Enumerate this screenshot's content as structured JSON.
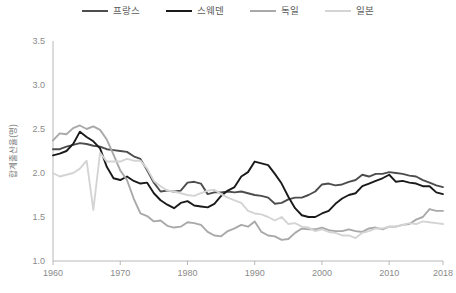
{
  "legend": {
    "position": "top-center",
    "items": [
      {
        "label": "프랑스",
        "color": "#4d4d4d",
        "key": "france"
      },
      {
        "label": "스웨덴",
        "color": "#1a1a1a",
        "key": "sweden"
      },
      {
        "label": "독일",
        "color": "#a9a9a9",
        "key": "germany"
      },
      {
        "label": "일본",
        "color": "#d4d4d4",
        "key": "japan"
      }
    ]
  },
  "axes": {
    "y_title": "합계출산율(명)",
    "y_ticks": [
      "1.0",
      "1.5",
      "2.0",
      "2.5",
      "3.0",
      "3.5"
    ],
    "x_ticks": [
      "1960",
      "1970",
      "1980",
      "1990",
      "2000",
      "2010",
      "2018"
    ]
  },
  "chart_data": {
    "type": "line",
    "title": "",
    "xlabel": "",
    "ylabel": "합계출산율(명)",
    "xlim": [
      1960,
      2018
    ],
    "ylim": [
      1.0,
      3.5
    ],
    "yticks": [
      1.0,
      1.5,
      2.0,
      2.5,
      3.0,
      3.5
    ],
    "xticks": [
      1960,
      1970,
      1980,
      1990,
      2000,
      2010,
      2018
    ],
    "grid": false,
    "legend_position": "top-center",
    "x": [
      1960,
      1961,
      1962,
      1963,
      1964,
      1965,
      1966,
      1967,
      1968,
      1969,
      1970,
      1971,
      1972,
      1973,
      1974,
      1975,
      1976,
      1977,
      1978,
      1979,
      1980,
      1981,
      1982,
      1983,
      1984,
      1985,
      1986,
      1987,
      1988,
      1989,
      1990,
      1991,
      1992,
      1993,
      1994,
      1995,
      1996,
      1997,
      1998,
      1999,
      2000,
      2001,
      2002,
      2003,
      2004,
      2005,
      2006,
      2007,
      2008,
      2009,
      2010,
      2011,
      2012,
      2013,
      2014,
      2015,
      2016,
      2017,
      2018
    ],
    "series": [
      {
        "name": "프랑스",
        "color": "#4d4d4d",
        "values": [
          2.27,
          2.27,
          2.3,
          2.32,
          2.34,
          2.33,
          2.31,
          2.3,
          2.27,
          2.26,
          2.25,
          2.24,
          2.19,
          2.16,
          2.03,
          1.89,
          1.79,
          1.8,
          1.79,
          1.8,
          1.89,
          1.9,
          1.88,
          1.76,
          1.78,
          1.78,
          1.79,
          1.78,
          1.79,
          1.77,
          1.75,
          1.74,
          1.72,
          1.65,
          1.66,
          1.7,
          1.72,
          1.72,
          1.75,
          1.79,
          1.87,
          1.88,
          1.86,
          1.87,
          1.9,
          1.92,
          1.98,
          1.96,
          1.99,
          1.99,
          2.01,
          2.0,
          1.99,
          1.97,
          1.96,
          1.92,
          1.89,
          1.86,
          1.84
        ]
      },
      {
        "name": "스웨덴",
        "color": "#1a1a1a",
        "values": [
          2.2,
          2.22,
          2.25,
          2.33,
          2.47,
          2.41,
          2.36,
          2.28,
          2.07,
          1.94,
          1.92,
          1.96,
          1.91,
          1.88,
          1.89,
          1.77,
          1.69,
          1.64,
          1.6,
          1.66,
          1.68,
          1.63,
          1.62,
          1.61,
          1.65,
          1.74,
          1.8,
          1.84,
          1.96,
          2.01,
          2.13,
          2.11,
          2.09,
          1.99,
          1.88,
          1.73,
          1.6,
          1.52,
          1.5,
          1.5,
          1.54,
          1.57,
          1.65,
          1.71,
          1.75,
          1.77,
          1.85,
          1.88,
          1.91,
          1.94,
          1.98,
          1.9,
          1.91,
          1.89,
          1.88,
          1.85,
          1.85,
          1.78,
          1.76
        ]
      },
      {
        "name": "독일",
        "color": "#a9a9a9",
        "values": [
          2.37,
          2.45,
          2.44,
          2.51,
          2.54,
          2.5,
          2.53,
          2.49,
          2.38,
          2.21,
          2.03,
          1.92,
          1.71,
          1.54,
          1.51,
          1.45,
          1.46,
          1.4,
          1.38,
          1.39,
          1.44,
          1.43,
          1.41,
          1.33,
          1.29,
          1.28,
          1.34,
          1.37,
          1.41,
          1.39,
          1.45,
          1.33,
          1.29,
          1.28,
          1.24,
          1.25,
          1.32,
          1.37,
          1.36,
          1.36,
          1.38,
          1.35,
          1.34,
          1.34,
          1.36,
          1.34,
          1.33,
          1.37,
          1.38,
          1.36,
          1.39,
          1.39,
          1.41,
          1.42,
          1.47,
          1.5,
          1.59,
          1.57,
          1.57
        ]
      },
      {
        "name": "일본",
        "color": "#d4d4d4",
        "values": [
          2.0,
          1.96,
          1.98,
          2.0,
          2.05,
          2.14,
          1.58,
          2.23,
          2.13,
          2.13,
          2.13,
          2.16,
          2.14,
          2.14,
          2.05,
          1.91,
          1.85,
          1.8,
          1.79,
          1.77,
          1.75,
          1.74,
          1.77,
          1.8,
          1.81,
          1.76,
          1.72,
          1.69,
          1.66,
          1.57,
          1.54,
          1.53,
          1.5,
          1.46,
          1.5,
          1.42,
          1.43,
          1.39,
          1.38,
          1.34,
          1.36,
          1.33,
          1.32,
          1.29,
          1.29,
          1.26,
          1.32,
          1.34,
          1.37,
          1.37,
          1.39,
          1.39,
          1.41,
          1.43,
          1.42,
          1.45,
          1.44,
          1.43,
          1.42
        ]
      }
    ]
  }
}
